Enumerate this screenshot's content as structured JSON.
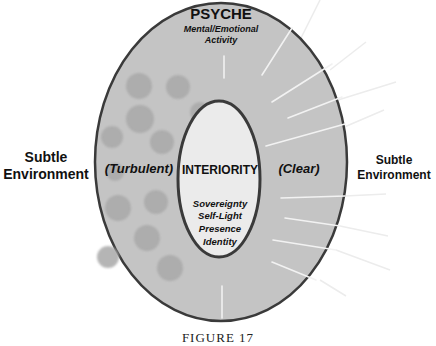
{
  "figure": {
    "caption": "FIGURE 17",
    "outer_region": {
      "title": "PSYCHE",
      "subtitle_lines": [
        "Mental/Emotional",
        "Activity"
      ],
      "left_state": "(Turbulent)",
      "right_state": "(Clear)"
    },
    "inner_region": {
      "title": "INTERIORITY",
      "qualities": [
        "Sovereignty",
        "Self-Light",
        "Presence",
        "Identity"
      ]
    },
    "left_label_lines": [
      "Subtle",
      "Environment"
    ],
    "right_label_lines": [
      "Subtle",
      "Environment"
    ],
    "colors": {
      "outer_fill": "#c4c4c4",
      "inner_fill": "#ebebeb",
      "stroke": "#3a3a3a",
      "turbulence": "#a9a9a9",
      "rays": "#f4f4f4"
    }
  }
}
